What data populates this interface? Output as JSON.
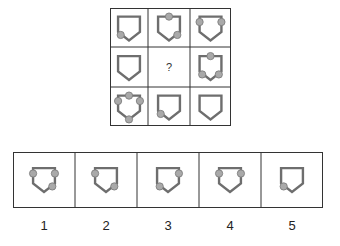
{
  "puzzle": {
    "question_mark": "?",
    "shape": "pentagon-shield",
    "colors": {
      "shape_stroke": "#6e6e6e",
      "dot_fill": "#a9a9a9",
      "dot_stroke": "#777777",
      "border": "#333333"
    },
    "matrix": [
      [
        {
          "dots": [
            "bottom-left"
          ]
        },
        {
          "dots": [
            "top",
            "bottom-right"
          ]
        },
        {
          "dots": [
            "left",
            "right"
          ]
        }
      ],
      [
        {
          "dots": []
        },
        {
          "missing": true
        },
        {
          "dots": [
            "top",
            "bottom-left",
            "bottom-right"
          ]
        }
      ],
      [
        {
          "dots": [
            "top",
            "left",
            "right",
            "bottom"
          ]
        },
        {
          "dots": [
            "bottom-left"
          ]
        },
        {
          "dots": []
        }
      ]
    ],
    "options": [
      {
        "label": "1",
        "dots": [
          "left",
          "right",
          "bottom-right"
        ]
      },
      {
        "label": "2",
        "dots": [
          "left",
          "bottom-right"
        ]
      },
      {
        "label": "3",
        "dots": [
          "right",
          "bottom-left"
        ]
      },
      {
        "label": "4",
        "dots": [
          "left",
          "right"
        ]
      },
      {
        "label": "5",
        "dots": [
          "bottom-left"
        ]
      }
    ]
  }
}
